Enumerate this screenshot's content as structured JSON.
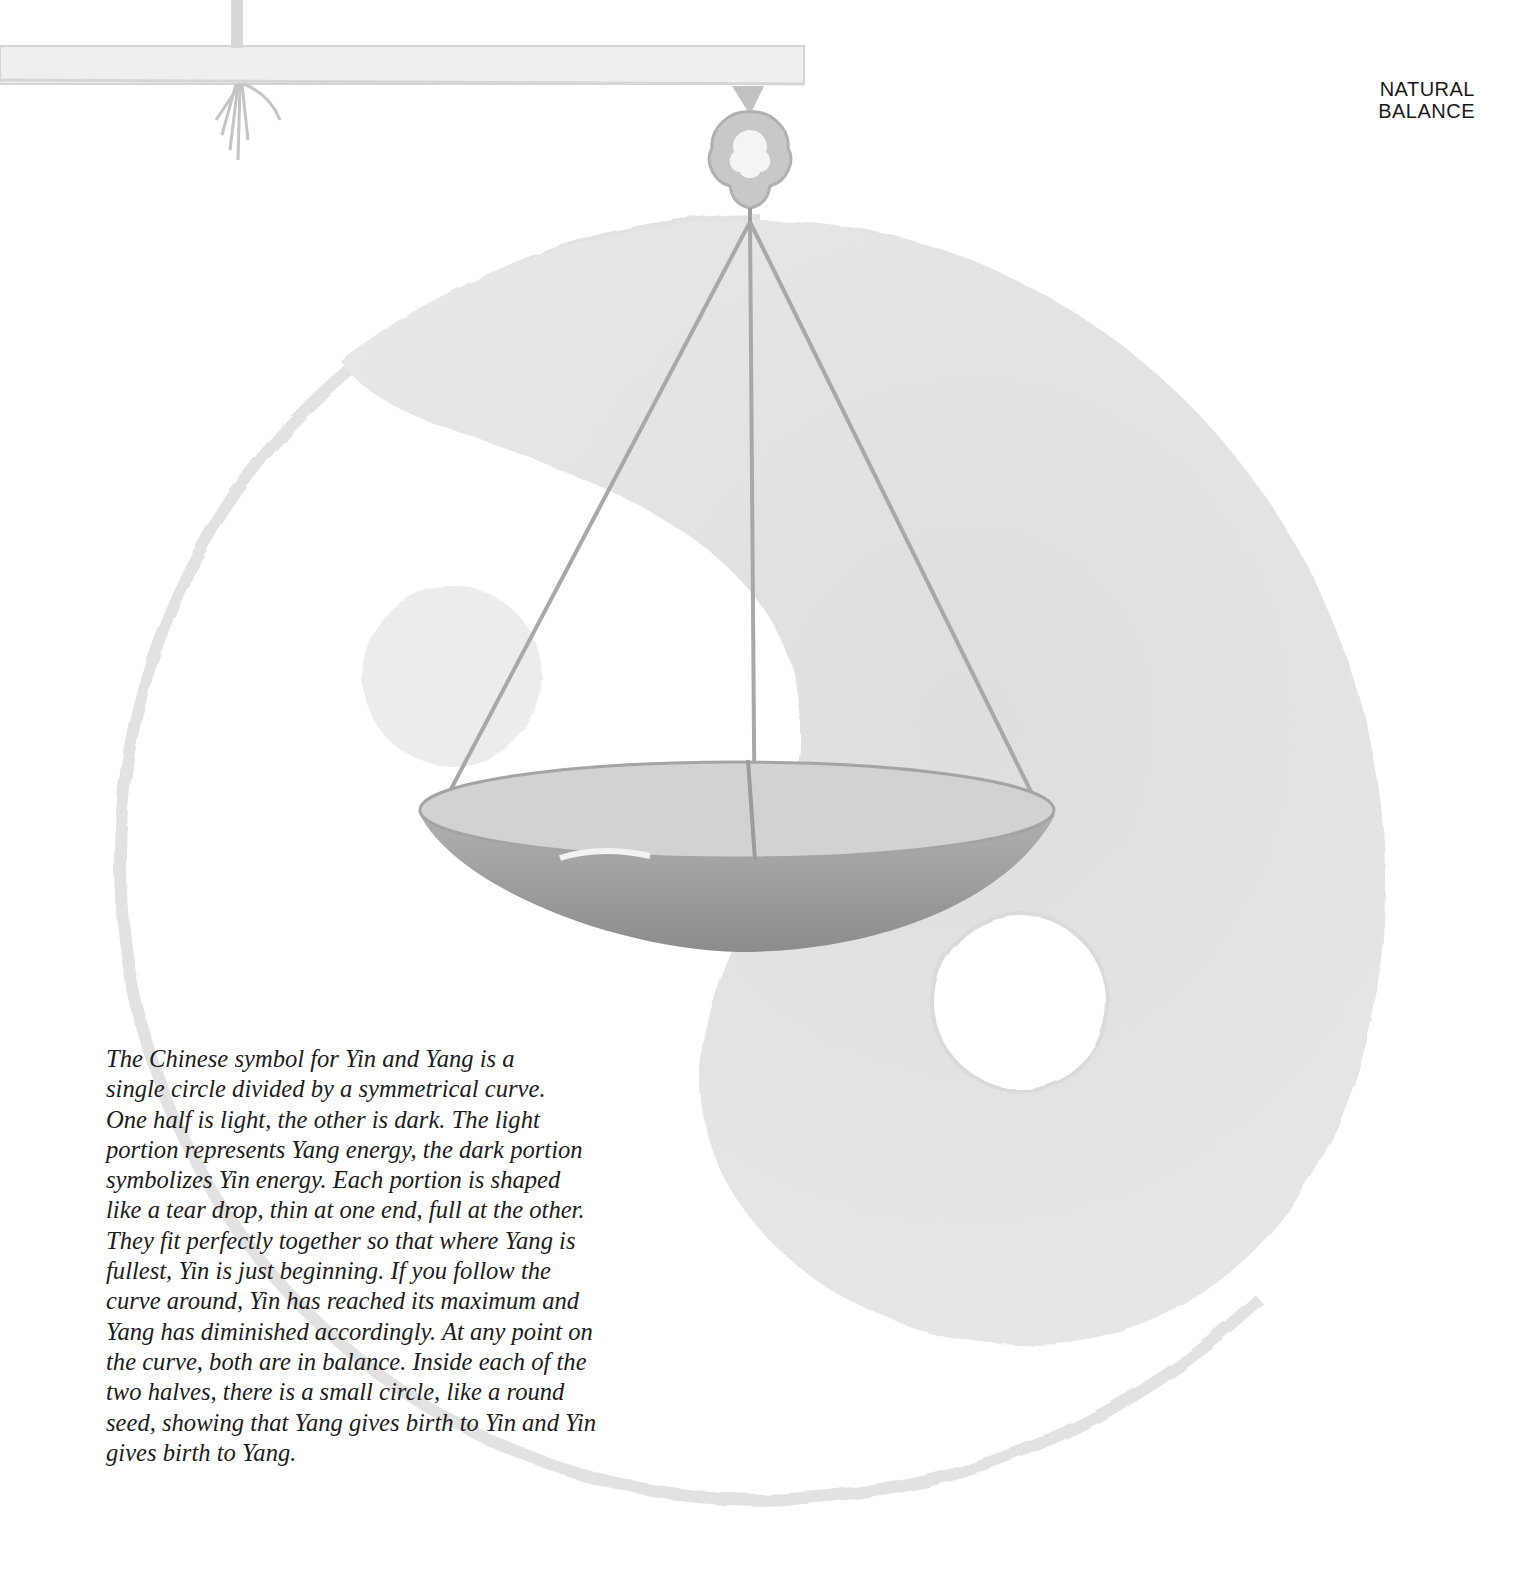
{
  "page": {
    "running_head": [
      "NATURAL",
      "BALANCE"
    ],
    "caption_lines": [
      "The Chinese symbol for Yin and Yang is a",
      "single circle divided by a symmetrical curve.",
      "One half is light, the other is dark. The light",
      "portion represents Yang energy, the dark portion",
      "symbolizes Yin energy. Each portion is shaped",
      "like a tear drop, thin at one end, full at the other.",
      "They fit perfectly together so that where Yang is",
      "fullest, Yin is just beginning. If you follow the",
      "curve around, Yin has reached its maximum and",
      "Yang has diminished accordingly. At any point on",
      "the curve, both are in balance. Inside each of the",
      "two halves, there is a small circle, like a round",
      "seed, showing that Yang gives birth to Yin and Yin",
      "gives birth to Yang."
    ]
  },
  "illustration": {
    "subject": "watercolor hanging scale pan over yin-yang symbol",
    "colors": {
      "yin_wash": "#e4e4e4",
      "outline_wash": "#e0e0e0",
      "pan_outer": "#9a9a9a",
      "pan_inner": "#cfcfcf",
      "strings": "#a6a6a6",
      "beam": "#ececec",
      "ornament": "#b5b5b5",
      "text": "#1c1c1c"
    }
  }
}
